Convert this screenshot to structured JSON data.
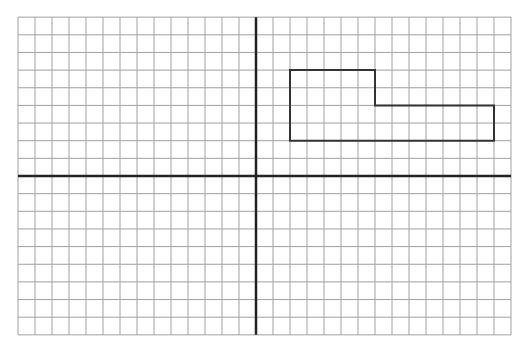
{
  "diagram": {
    "type": "coordinate-grid",
    "x_range": [
      -14,
      15
    ],
    "y_range": [
      -9,
      9
    ],
    "grid_step": 1,
    "colors": {
      "grid": "#a0a0a0",
      "axes": "#222222",
      "shape": "#333333"
    },
    "shape": {
      "name": "L-shaped polygon",
      "vertices": [
        [
          2,
          6
        ],
        [
          7,
          6
        ],
        [
          7,
          4
        ],
        [
          14,
          4
        ],
        [
          14,
          2
        ],
        [
          2,
          2
        ]
      ]
    }
  }
}
